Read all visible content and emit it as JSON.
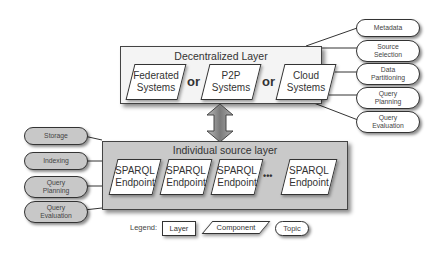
{
  "decentralized_layer": {
    "title": "Decentralized Layer",
    "components": [
      {
        "line1": "Federated",
        "line2": "Systems"
      },
      {
        "line1": "P2P",
        "line2": "Systems"
      },
      {
        "line1": "Cloud",
        "line2": "Systems"
      }
    ],
    "separator": "or",
    "topics": [
      {
        "line1": "Metadata",
        "line2": ""
      },
      {
        "line1": "Source",
        "line2": "Selection"
      },
      {
        "line1": "Data",
        "line2": "Partitioning"
      },
      {
        "line1": "Query",
        "line2": "Planning"
      },
      {
        "line1": "Query",
        "line2": "Evaluation"
      }
    ]
  },
  "individual_layer": {
    "title": "Individual source layer",
    "components": [
      {
        "line1": "SPARQL",
        "line2": "Endpoint"
      },
      {
        "line1": "SPARQL",
        "line2": "Endpoint"
      },
      {
        "line1": "SPARQL",
        "line2": "Endpoint"
      },
      {
        "line1": "SPARQL",
        "line2": "Endpoint"
      }
    ],
    "ellipsis": "•••",
    "topics": [
      {
        "line1": "Storage",
        "line2": ""
      },
      {
        "line1": "Indexing",
        "line2": ""
      },
      {
        "line1": "Query",
        "line2": "Planning"
      },
      {
        "line1": "Query",
        "line2": "Evaluation"
      }
    ]
  },
  "legend": {
    "label": "Legend:",
    "layer": "Layer",
    "component": "Component",
    "topic": "Topic"
  },
  "colors": {
    "decentralized_bg": "#f4f4f4",
    "individual_bg": "#c9c9c9",
    "topic_grey": "#c8c8c8",
    "arrow": "#8a8a8a"
  }
}
